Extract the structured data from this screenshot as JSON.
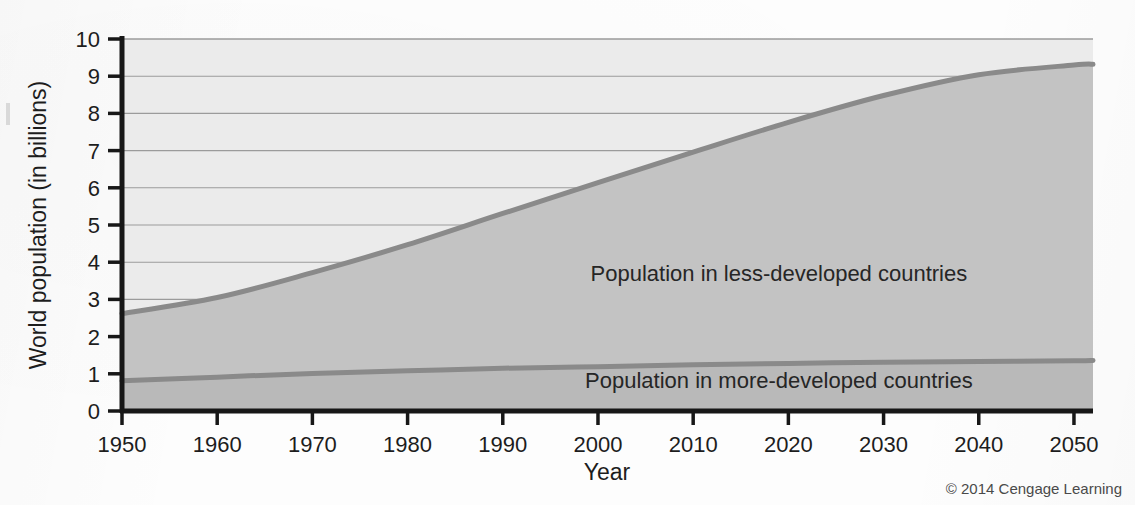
{
  "figure": {
    "credit": "© 2014 Cengage Learning",
    "background_color": "#fdfdfd"
  },
  "chart_data": {
    "type": "area",
    "title": "",
    "subtitle": "",
    "xlabel": "Year",
    "ylabel": "World population (in billions)",
    "xlim": [
      1950,
      2052
    ],
    "ylim": [
      0,
      10
    ],
    "grid": true,
    "legend_position": "inside-plot",
    "x_ticks": [
      "1950",
      "1960",
      "1970",
      "1980",
      "1990",
      "2000",
      "2010",
      "2020",
      "2030",
      "2040",
      "2050"
    ],
    "x_tick_values": [
      1950,
      1960,
      1970,
      1980,
      1990,
      2000,
      2010,
      2020,
      2030,
      2040,
      2050
    ],
    "y_ticks": [
      "0",
      "1",
      "2",
      "3",
      "4",
      "5",
      "6",
      "7",
      "8",
      "9",
      "10"
    ],
    "y_tick_values": [
      0,
      1,
      2,
      3,
      4,
      5,
      6,
      7,
      8,
      9,
      10
    ],
    "x": [
      1950,
      1960,
      1970,
      1980,
      1990,
      2000,
      2010,
      2020,
      2030,
      2040,
      2050,
      2052
    ],
    "series": [
      {
        "name": "Population in more-developed countries",
        "label": "Population in more-developed countries",
        "stacked_order": 1,
        "fill_color": "#b9b9b9",
        "line_color": "#8a8a8a",
        "values": [
          0.81,
          0.91,
          1.01,
          1.08,
          1.15,
          1.19,
          1.24,
          1.28,
          1.31,
          1.33,
          1.35,
          1.36
        ]
      },
      {
        "name": "Population in less-developed countries",
        "label": "Population in less-developed countries",
        "stacked_order": 2,
        "fill_color": "#c3c3c3",
        "line_color": "#8a8a8a",
        "cumulative_total_values": [
          2.62,
          3.05,
          3.72,
          4.47,
          5.31,
          6.14,
          6.96,
          7.76,
          8.48,
          9.04,
          9.3,
          9.32
        ],
        "values": [
          1.81,
          2.14,
          2.71,
          3.39,
          4.16,
          4.95,
          5.72,
          6.48,
          7.17,
          7.71,
          7.95,
          7.96
        ]
      }
    ],
    "upper_plot_fill_color": "#ebebeb",
    "annotations": [
      {
        "text": "Population in less-developed countries",
        "x_value": 2019,
        "y_value": 3.5
      },
      {
        "text": "Population in more-developed countries",
        "x_value": 2019,
        "y_value": 0.62
      }
    ]
  }
}
